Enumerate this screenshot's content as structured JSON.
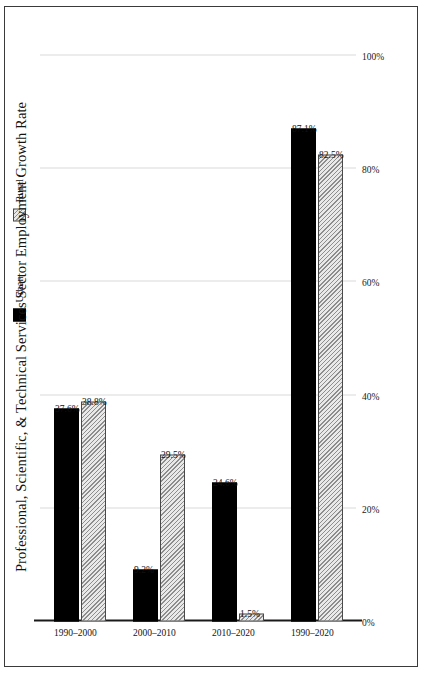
{
  "chart_data": {
    "type": "bar",
    "orientation": "horizontal-rotated",
    "title": "Professional, Scientific, & Technical Services Sector Employment Growth Rate",
    "xlabel": "",
    "ylabel": "",
    "categories": [
      "1990–2000",
      "2000–2010",
      "2010–2020",
      "1990–2020"
    ],
    "series": [
      {
        "name": "Urban",
        "color": "#000000",
        "fill": "solid",
        "values": [
          37.6,
          9.2,
          24.6,
          87.1
        ],
        "labels": [
          "37.6%",
          "9.2%",
          "24.6%",
          "87.1%"
        ]
      },
      {
        "name": "Rural",
        "color": "#e9e9e9",
        "fill": "hatched",
        "values": [
          38.8,
          29.5,
          1.5,
          82.5
        ],
        "labels": [
          "38.8%",
          "29.5%",
          "1.5%",
          "82.5%"
        ]
      }
    ],
    "ylim": [
      0,
      100
    ],
    "tick_values": [
      0,
      20,
      40,
      60,
      80,
      100
    ],
    "tick_labels": [
      "0%",
      "20%",
      "40%",
      "60%",
      "80%",
      "100%"
    ],
    "grid": true,
    "legend_position": "right"
  },
  "legend": {
    "items": [
      {
        "label": "Urban",
        "swatch": "solid-black-swatch"
      },
      {
        "label": "Rural",
        "swatch": "hatched-gray-swatch"
      }
    ]
  }
}
